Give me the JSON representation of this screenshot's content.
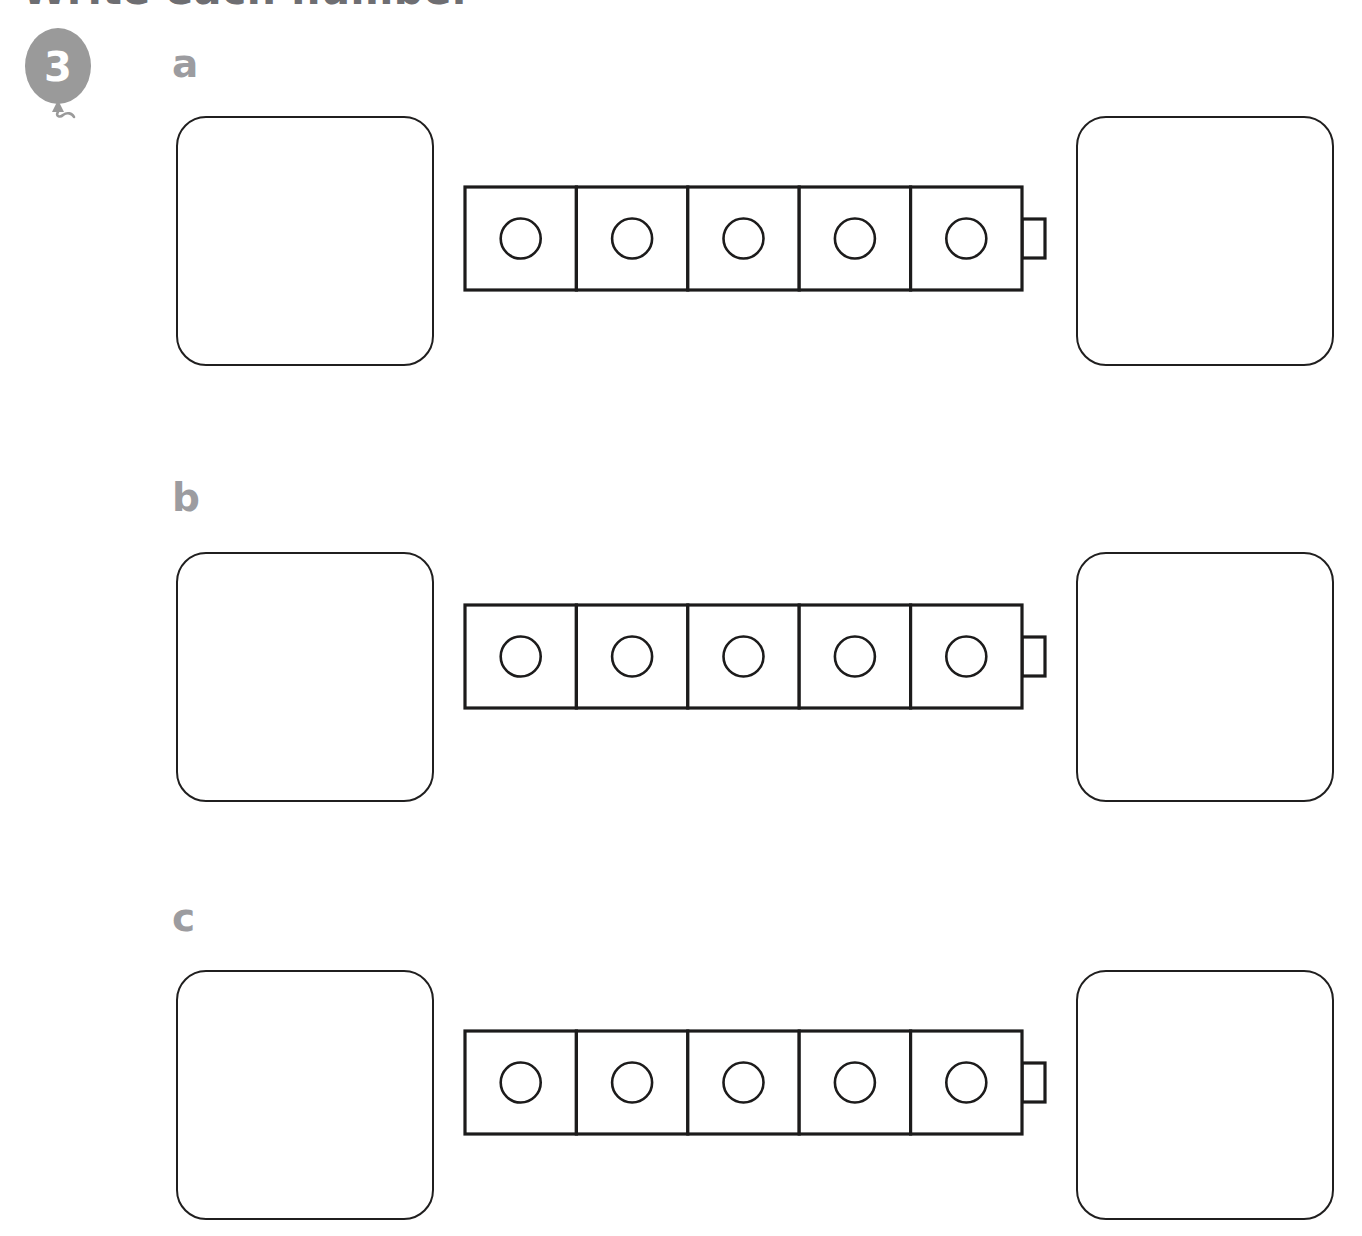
{
  "page": {
    "title": "Write each number",
    "background_color": "#ffffff",
    "ink_color": "#1c1b1b",
    "label_color": "#9c9ca0",
    "balloon_color": "#9a9a9a"
  },
  "question": {
    "number": "3",
    "marker_shape": "balloon",
    "instruction": "Write each number"
  },
  "rows": [
    {
      "label": "a",
      "cube_count": 5,
      "stud_count": 5,
      "has_connector_nub": true,
      "left_answer_value": "",
      "right_answer_value": ""
    },
    {
      "label": "b",
      "cube_count": 5,
      "stud_count": 5,
      "has_connector_nub": true,
      "left_answer_value": "",
      "right_answer_value": ""
    },
    {
      "label": "c",
      "cube_count": 5,
      "stud_count": 5,
      "has_connector_nub": true,
      "left_answer_value": "",
      "right_answer_value": ""
    }
  ]
}
